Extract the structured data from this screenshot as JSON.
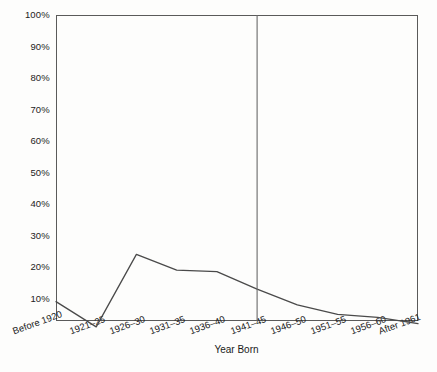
{
  "chart_data": {
    "type": "line",
    "title": "",
    "subtitle": "",
    "xlabel": "Year Born",
    "ylabel": "",
    "categories": [
      "Before 1920",
      "1921–25",
      "1926–30",
      "1931–35",
      "1936–40",
      "1941–45",
      "1946–50",
      "1951–55",
      "1956–60",
      "After 1961"
    ],
    "values": [
      9,
      1,
      24,
      19,
      18.5,
      13,
      8,
      5,
      4,
      2
    ],
    "ytick_labels": [
      "100%",
      "90%",
      "80%",
      "70%",
      "60%",
      "50%",
      "40%",
      "30%",
      "20%",
      "10%"
    ],
    "ytick_values": [
      100,
      90,
      80,
      70,
      60,
      50,
      40,
      30,
      20,
      10
    ],
    "ylim": [
      0,
      100
    ],
    "grid": false,
    "legend": null,
    "legend_position": "none",
    "annotations": [
      {
        "name": "vertical-reference-line",
        "type": "vline",
        "at_category": "1941–45",
        "label": ""
      }
    ],
    "line_color": "#4a4a4a",
    "axis_color": "#5a5a5a",
    "background_color": "#fdfdfc"
  },
  "geometry": {
    "plot_left": 56,
    "plot_right": 418,
    "plot_top": 15,
    "plot_bottom": 321,
    "value_zero_y": 330,
    "value_hundred_y": 15
  }
}
